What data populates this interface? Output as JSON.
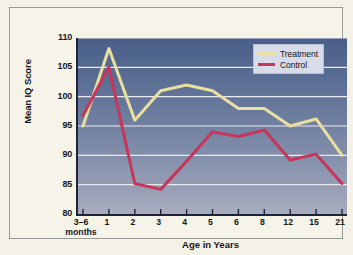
{
  "chart_data": {
    "type": "line",
    "title": "",
    "xlabel": "Age in Years",
    "ylabel": "Mean IQ Score",
    "categories": [
      "3–6 months",
      "1",
      "2",
      "3",
      "4",
      "5",
      "6",
      "8",
      "12",
      "15",
      "21"
    ],
    "category_labels": [
      {
        "main": "3–6",
        "sub": "months"
      },
      {
        "main": "1",
        "sub": ""
      },
      {
        "main": "2",
        "sub": ""
      },
      {
        "main": "3",
        "sub": ""
      },
      {
        "main": "4",
        "sub": ""
      },
      {
        "main": "5",
        "sub": ""
      },
      {
        "main": "6",
        "sub": ""
      },
      {
        "main": "8",
        "sub": ""
      },
      {
        "main": "12",
        "sub": ""
      },
      {
        "main": "15",
        "sub": ""
      },
      {
        "main": "21",
        "sub": ""
      }
    ],
    "ylim": [
      80,
      110
    ],
    "yticks": [
      80,
      85,
      90,
      95,
      100,
      105,
      110
    ],
    "grid": true,
    "grid_color": "#e9eaf2",
    "legend_position": "top-right",
    "series": [
      {
        "name": "Treatment",
        "color": "#e8dfa0",
        "values": [
          95.0,
          108.2,
          96.0,
          101.0,
          102.0,
          101.0,
          98.0,
          98.0,
          95.0,
          96.2,
          90.0
        ]
      },
      {
        "name": "Control",
        "color": "#c8345a",
        "values": [
          96.8,
          105.0,
          85.2,
          84.2,
          89.0,
          94.0,
          93.2,
          94.3,
          89.2,
          90.2,
          85.2
        ]
      }
    ]
  },
  "legend": {
    "items": [
      {
        "label": "Treatment",
        "color": "#e8dfa0"
      },
      {
        "label": "Control",
        "color": "#c8345a"
      }
    ]
  },
  "axes": {
    "y_title": "Mean IQ Score",
    "x_title": "Age in Years"
  }
}
